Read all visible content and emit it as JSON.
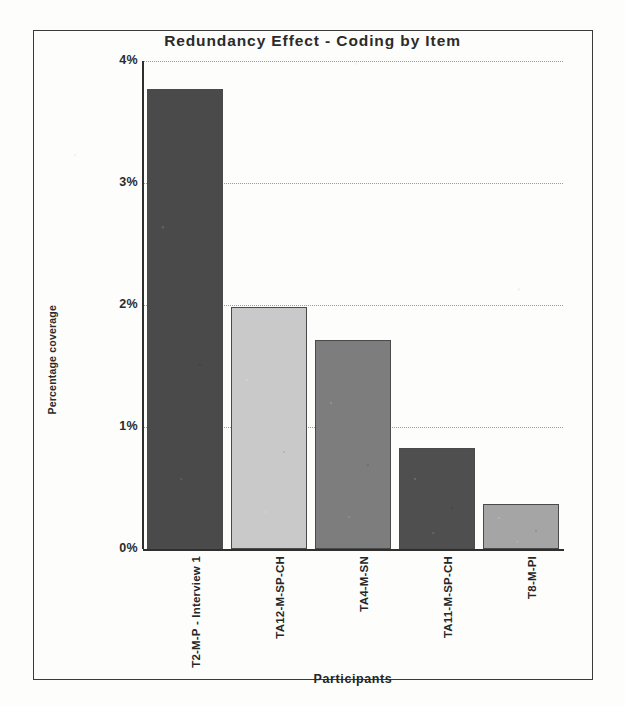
{
  "chart_data": {
    "type": "bar",
    "title": "Redundancy Effect - Coding by Item",
    "xlabel": "Participants",
    "ylabel": "Percentage coverage",
    "categories": [
      "T2-M-P - Interview 1",
      "TA12-M-SP-CH",
      "TA4-M-SN",
      "TA11-M-SP-CH",
      "T8-M-PI"
    ],
    "values": [
      3.77,
      1.98,
      1.71,
      0.83,
      0.37
    ],
    "value_labels": [
      "3.77%",
      "1.98%",
      "1.71%",
      "0.83%",
      "0.37%"
    ],
    "ylim": [
      0,
      4
    ],
    "ytick_labels": [
      "4%",
      "3%",
      "2%",
      "1%",
      "0%"
    ],
    "ytick_values": [
      4,
      3,
      2,
      1,
      0
    ],
    "grid": true,
    "legend": "none",
    "bar_colors": [
      "#4a4a4a",
      "#c9c9c9",
      "#7d7d7d",
      "#4f4f4f",
      "#a5a5a5"
    ],
    "bar_border_color": "#4a4a4a",
    "axis_color": "#2f2f2f",
    "gridline_color": "#9a9a9a",
    "frame_color": "#3a3a3a",
    "text_color": "#2b2b2b"
  }
}
